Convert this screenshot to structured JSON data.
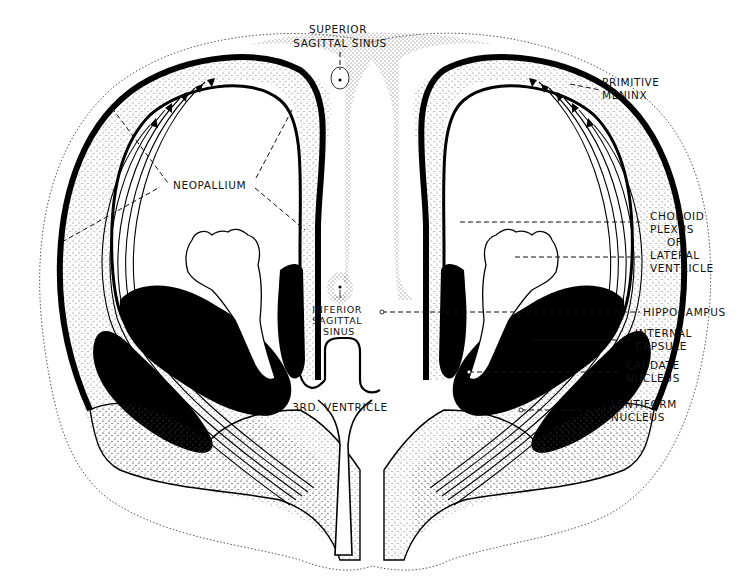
{
  "figure": {
    "colors": {
      "ink": "#000000",
      "background": "#ffffff",
      "stipple": "#8a8a8a"
    }
  },
  "labels": {
    "superior_sagittal_sinus": [
      "SUPERIOR",
      "SAGITTAL SINUS"
    ],
    "primitive_meninx": [
      "PRIMITIVE",
      "MENINX"
    ],
    "neopallium": "NEOPALLIUM",
    "choroid_plexus": [
      "CHOROID",
      "PLEXUS",
      "OF",
      "LATERAL",
      "VENTRICLE"
    ],
    "inferior_sagittal_sinus": [
      "INFERIOR",
      "SAGITTAL",
      "SINUS"
    ],
    "hippocampus": "HIPPOCAMPUS",
    "internal_capsule": [
      "INTERNAL",
      "CAPSULE"
    ],
    "caudate_nucleus": [
      "CAUDATE",
      "NUCLEUS"
    ],
    "lentiform_nucleus": [
      "LENTIFORM",
      "NUCLEUS"
    ],
    "third_ventricle": "3RD. VENTRICLE"
  }
}
